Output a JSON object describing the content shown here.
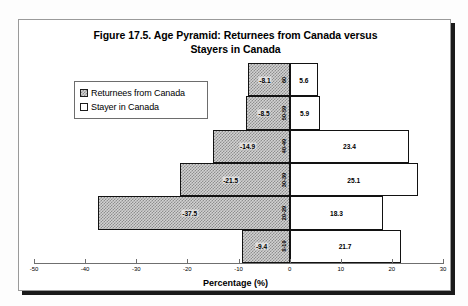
{
  "figure": {
    "title_line1": "Figure 17.5. Age Pyramid: Returnees from Canada versus",
    "title_line2": "Stayers in Canada"
  },
  "legend": {
    "items": [
      {
        "label": "Returnees from Canada",
        "swatch": "shaded",
        "color": "#d2d2d2"
      },
      {
        "label": "Stayer in Canada",
        "swatch": "plain",
        "color": "#ffffff"
      }
    ]
  },
  "axis": {
    "x_title": "Percentage (%)",
    "ticks": [
      "-50",
      "-40",
      "-30",
      "-20",
      "-10",
      "0",
      "10",
      "20",
      "30"
    ]
  },
  "chart_data": {
    "type": "bar",
    "subtype": "population-pyramid",
    "title": "Figure 17.5. Age Pyramid: Returnees from Canada versus Stayers in Canada",
    "xlabel": "Percentage (%)",
    "ylabel": "",
    "xlim": [
      -50,
      30
    ],
    "xticks": [
      -50,
      -40,
      -30,
      -20,
      -10,
      0,
      10,
      20,
      30
    ],
    "grid": false,
    "legend_position": "upper-left",
    "categories": [
      "60",
      "50-59",
      "40-49",
      "30-39",
      "20-29",
      "0-19"
    ],
    "series": [
      {
        "name": "Returnees from Canada",
        "side": "left",
        "values": [
          -8.1,
          -8.5,
          -14.9,
          -21.5,
          -37.5,
          -9.4
        ],
        "labels": [
          "-8.1",
          "-8.5",
          "-14.9",
          "-21.5",
          "-37.5",
          "-9.4"
        ]
      },
      {
        "name": "Stayer in Canada",
        "side": "right",
        "values": [
          5.6,
          5.9,
          23.4,
          25.1,
          18.3,
          21.7
        ],
        "labels": [
          "5.6",
          "5.9",
          "23.4",
          "25.1",
          "18.3",
          "21.7"
        ]
      }
    ]
  }
}
